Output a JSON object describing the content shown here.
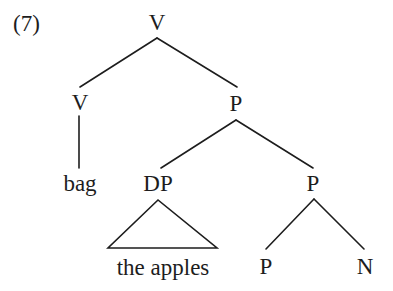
{
  "figure": {
    "example_number": "(7)",
    "type": "syntax-tree",
    "background_color": "#ffffff",
    "line_color": "#1d1d1d",
    "text_color": "#1d1d1d"
  },
  "nodes": {
    "root_v": {
      "label": "V",
      "x": 157,
      "y": 30
    },
    "left_v": {
      "label": "V",
      "x": 80,
      "y": 110
    },
    "bag": {
      "label": "bag",
      "x": 80,
      "y": 191
    },
    "upper_p": {
      "label": "P",
      "x": 236,
      "y": 111
    },
    "dp": {
      "label": "DP",
      "x": 158,
      "y": 191
    },
    "lower_p": {
      "label": "P",
      "x": 313,
      "y": 191
    },
    "the_apples": {
      "label": "the apples",
      "x": 163,
      "y": 275
    },
    "terminal_p": {
      "label": "P",
      "x": 266,
      "y": 274
    },
    "terminal_n": {
      "label": "N",
      "x": 365,
      "y": 274
    }
  },
  "branches": [
    {
      "name": "root-v-to-left-v",
      "x1": 157,
      "y1": 38,
      "x2": 80,
      "y2": 87
    },
    {
      "name": "root-v-to-upper-p",
      "x1": 157,
      "y1": 38,
      "x2": 237,
      "y2": 87
    },
    {
      "name": "left-v-to-bag",
      "x1": 79,
      "y1": 116,
      "x2": 79,
      "y2": 168
    },
    {
      "name": "upper-p-to-dp",
      "x1": 236,
      "y1": 120,
      "x2": 161,
      "y2": 168
    },
    {
      "name": "upper-p-to-lower-p",
      "x1": 236,
      "y1": 120,
      "x2": 313,
      "y2": 168
    },
    {
      "name": "lower-p-to-terminal-p",
      "x1": 314,
      "y1": 199,
      "x2": 266,
      "y2": 249
    },
    {
      "name": "lower-p-to-terminal-n",
      "x1": 314,
      "y1": 199,
      "x2": 364,
      "y2": 249
    }
  ],
  "triangle": {
    "name": "dp-triangle",
    "apex_x": 158,
    "apex_y": 200,
    "base_left_x": 108,
    "base_right_x": 217,
    "base_y": 248
  }
}
